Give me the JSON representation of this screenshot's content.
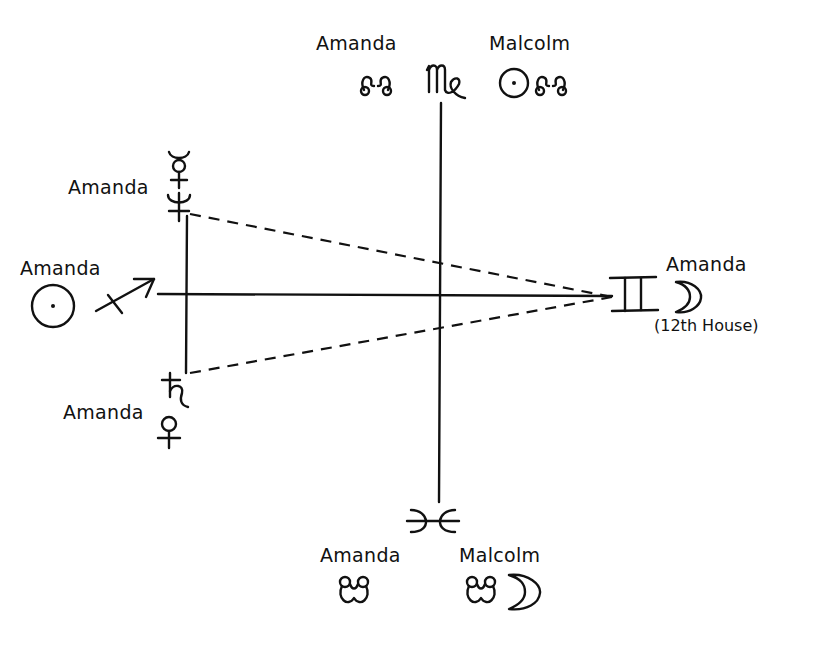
{
  "diagram": {
    "type": "astrological-aspect-diagram",
    "ink_color": "#111111",
    "background": "#ffffff",
    "axes": {
      "vertical": {
        "top_sign": "Virgo",
        "bottom_sign": "Pisces"
      },
      "horizontal": {
        "left_sign": "Sagittarius",
        "right_sign": "Gemini"
      }
    },
    "top": {
      "sign_glyph": "virgo-glyph",
      "left_group": {
        "person": "Amanda",
        "symbols": [
          "north-node"
        ]
      },
      "right_group": {
        "person": "Malcolm",
        "symbols": [
          "sun",
          "north-node"
        ]
      }
    },
    "bottom": {
      "sign_glyph": "pisces-glyph",
      "left_group": {
        "person": "Amanda",
        "symbols": [
          "south-node"
        ]
      },
      "right_group": {
        "person": "Malcolm",
        "symbols": [
          "south-node",
          "moon"
        ]
      }
    },
    "left": {
      "sign_glyph": "sagittarius-glyph",
      "sun_group": {
        "person": "Amanda",
        "symbols": [
          "sun"
        ]
      },
      "upper_group": {
        "person": "Amanda",
        "symbols": [
          "mercury",
          "neptune"
        ]
      },
      "lower_group": {
        "person": "Amanda",
        "symbols": [
          "saturn",
          "venus"
        ]
      }
    },
    "right": {
      "sign_glyph": "gemini-glyph",
      "group": {
        "person": "Amanda",
        "symbols": [
          "moon"
        ],
        "note": "(12th House)"
      }
    },
    "aspect_lines": [
      {
        "from": "Amanda Neptune",
        "to": "Amanda Moon",
        "style": "dashed"
      },
      {
        "from": "Amanda Saturn",
        "to": "Amanda Moon",
        "style": "dashed"
      }
    ]
  }
}
